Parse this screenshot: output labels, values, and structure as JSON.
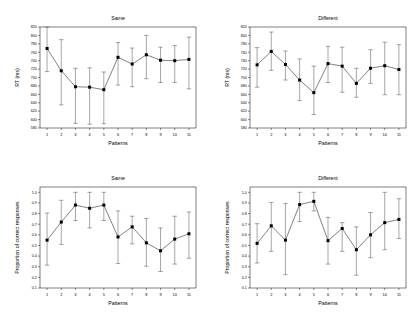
{
  "figure": {
    "panels": [
      {
        "id": "rt-same",
        "title": "Same",
        "xlabel": "Patterns",
        "ylabel": "RT (ms)"
      },
      {
        "id": "rt-different",
        "title": "Different",
        "xlabel": "Patterns",
        "ylabel": "RT (ms)"
      },
      {
        "id": "acc-same",
        "title": "Same",
        "xlabel": "Patterns",
        "ylabel": "Proportion of correct responses"
      },
      {
        "id": "acc-different",
        "title": "Different",
        "xlabel": "Patterns",
        "ylabel": "Proportion of correct responses"
      }
    ]
  },
  "chart_data": [
    {
      "type": "line",
      "id": "rt-same",
      "title": "Same",
      "xlabel": "Patterns",
      "ylabel": "RT (ms)",
      "categories": [
        1,
        2,
        3,
        4,
        5,
        6,
        7,
        8,
        9,
        10,
        11
      ],
      "x_tick_labels": [
        "1",
        "2",
        "3",
        "4",
        "5",
        "6",
        "7",
        "8",
        "9",
        "10",
        "11"
      ],
      "y_tick_labels": [
        "580",
        "600",
        "620",
        "640",
        "660",
        "680",
        "700",
        "720",
        "740",
        "760",
        "780",
        "800",
        "820"
      ],
      "ylim": [
        580,
        820
      ],
      "xlim": [
        0.5,
        11.5
      ],
      "grid": false,
      "legend": "none",
      "marker": "filled-square",
      "values": [
        769,
        716,
        678,
        677,
        671,
        748,
        732,
        754,
        741,
        740,
        743
      ],
      "error_upper": [
        822,
        790,
        722,
        723,
        713,
        783,
        770,
        800,
        772,
        776,
        796
      ],
      "error_lower": [
        714,
        635,
        591,
        589,
        590,
        682,
        678,
        697,
        688,
        688,
        673
      ]
    },
    {
      "type": "line",
      "id": "rt-different",
      "title": "Different",
      "xlabel": "Patterns",
      "ylabel": "RT (ms)",
      "categories": [
        1,
        2,
        3,
        4,
        5,
        6,
        7,
        8,
        9,
        10,
        11
      ],
      "x_tick_labels": [
        "1",
        "2",
        "3",
        "4",
        "5",
        "6",
        "7",
        "8",
        "9",
        "10",
        "11"
      ],
      "y_tick_labels": [
        "580",
        "600",
        "620",
        "640",
        "660",
        "680",
        "700",
        "720",
        "740",
        "760",
        "780",
        "800",
        "820"
      ],
      "ylim": [
        580,
        820
      ],
      "xlim": [
        0.5,
        11.5
      ],
      "grid": false,
      "legend": "none",
      "marker": "filled-square",
      "values": [
        730,
        762,
        731,
        694,
        664,
        733,
        727,
        686,
        722,
        728,
        719
      ],
      "error_upper": [
        771,
        808,
        763,
        744,
        727,
        774,
        772,
        722,
        766,
        784,
        778
      ],
      "error_lower": [
        677,
        717,
        694,
        645,
        612,
        688,
        665,
        653,
        686,
        659,
        659
      ]
    },
    {
      "type": "line",
      "id": "acc-same",
      "title": "Same",
      "xlabel": "Patterns",
      "ylabel": "Proportion of correct responses",
      "categories": [
        1,
        2,
        3,
        4,
        5,
        6,
        7,
        8,
        9,
        10,
        11
      ],
      "x_tick_labels": [
        "1",
        "2",
        "3",
        "4",
        "5",
        "6",
        "7",
        "8",
        "9",
        "10",
        "11"
      ],
      "y_tick_labels": [
        "0.1",
        "0.2",
        "0.3",
        "0.4",
        "0.5",
        "0.6",
        "0.7",
        "0.8",
        "0.9",
        "1.0"
      ],
      "ylim": [
        0.1,
        1.05
      ],
      "xlim": [
        0.5,
        11.5
      ],
      "grid": false,
      "legend": "none",
      "marker": "filled-square",
      "values": [
        0.55,
        0.72,
        0.88,
        0.85,
        0.88,
        0.58,
        0.675,
        0.525,
        0.45,
        0.56,
        0.61
      ],
      "error_upper": [
        0.805,
        0.925,
        1.0,
        1.0,
        1.0,
        0.825,
        0.775,
        0.755,
        0.665,
        0.775,
        0.815
      ],
      "error_lower": [
        0.315,
        0.51,
        0.735,
        0.665,
        0.735,
        0.33,
        0.515,
        0.305,
        0.255,
        0.325,
        0.38
      ]
    },
    {
      "type": "line",
      "id": "acc-different",
      "title": "Different",
      "xlabel": "Patterns",
      "ylabel": "Proportion of correct responses",
      "categories": [
        1,
        2,
        3,
        4,
        5,
        6,
        7,
        8,
        9,
        10,
        11
      ],
      "x_tick_labels": [
        "1",
        "2",
        "3",
        "4",
        "5",
        "6",
        "7",
        "8",
        "9",
        "10",
        "11"
      ],
      "y_tick_labels": [
        "0.1",
        "0.2",
        "0.3",
        "0.4",
        "0.5",
        "0.6",
        "0.7",
        "0.8",
        "0.9",
        "1.0"
      ],
      "ylim": [
        0.1,
        1.05
      ],
      "xlim": [
        0.5,
        11.5
      ],
      "grid": false,
      "legend": "none",
      "marker": "filled-square",
      "values": [
        0.52,
        0.685,
        0.55,
        0.885,
        0.915,
        0.545,
        0.66,
        0.46,
        0.6,
        0.715,
        0.745
      ],
      "error_upper": [
        0.705,
        0.905,
        0.895,
        1.0,
        1.0,
        0.765,
        0.715,
        0.675,
        0.81,
        1.0,
        0.94
      ],
      "error_lower": [
        0.335,
        0.445,
        0.225,
        0.725,
        0.825,
        0.325,
        0.445,
        0.22,
        0.385,
        0.46,
        0.565
      ]
    }
  ]
}
